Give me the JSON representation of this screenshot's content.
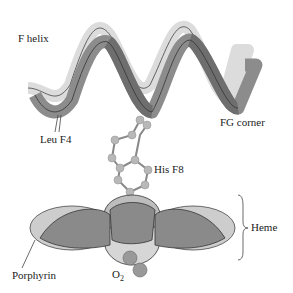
{
  "labels": {
    "f_helix": "F helix",
    "leu_f4": "Leu F4",
    "fg_corner": "FG corner",
    "his_f8": "His F8",
    "heme": "Heme",
    "porphyrin": "Porphyrin",
    "o2": "O",
    "o2_sub": "2"
  },
  "colors": {
    "ribbon_light": "#dcdcdc",
    "ribbon_mid": "#a8a8a8",
    "ribbon_dark": "#6e6e6e",
    "heme_light": "#c8c8c8",
    "heme_dark": "#8a8a8a",
    "atom": "#b0b0b0"
  }
}
